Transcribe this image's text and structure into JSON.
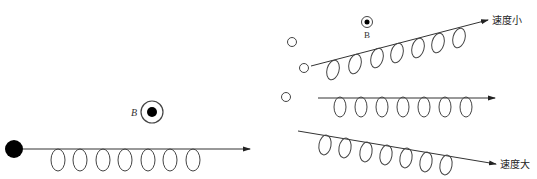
{
  "diagram": {
    "colors": {
      "stroke": "#444444",
      "fill_dark": "#000000",
      "background": "#ffffff"
    },
    "field_symbols": [
      {
        "label": "B",
        "style": "italic",
        "cx": 152,
        "cy": 112,
        "r_outer": 11,
        "r_inner": 5
      },
      {
        "label": "B",
        "style": "upright",
        "cx": 367,
        "cy": 22,
        "r_outer": 5.5,
        "r_inner": 2.5
      }
    ],
    "source_particle": {
      "cx": 14,
      "cy": 149,
      "r": 9
    },
    "incoming_beam": {
      "x1": 23,
      "y1": 149,
      "x2": 250,
      "y2": 149,
      "loops": [
        {
          "cx": 58,
          "cy": 160
        },
        {
          "cx": 80,
          "cy": 160
        },
        {
          "cx": 103,
          "cy": 160
        },
        {
          "cx": 125,
          "cy": 160
        },
        {
          "cx": 148,
          "cy": 160
        },
        {
          "cx": 170,
          "cy": 160
        },
        {
          "cx": 193,
          "cy": 160
        }
      ]
    },
    "split_particles": [
      {
        "cx": 292,
        "cy": 42,
        "r": 4.5
      },
      {
        "cx": 304,
        "cy": 68,
        "r": 4.5
      },
      {
        "cx": 286,
        "cy": 97,
        "r": 4.5
      }
    ],
    "beams": [
      {
        "name": "slow",
        "label": "速度小",
        "x1": 311,
        "y1": 66,
        "x2": 488,
        "y2": 20,
        "label_x": 492,
        "label_y": 22,
        "loops": [
          {
            "cx": 333,
            "cy": 70
          },
          {
            "cx": 355,
            "cy": 64
          },
          {
            "cx": 377,
            "cy": 58
          },
          {
            "cx": 397,
            "cy": 53
          },
          {
            "cx": 418,
            "cy": 48
          },
          {
            "cx": 438,
            "cy": 43
          },
          {
            "cx": 459,
            "cy": 38
          }
        ]
      },
      {
        "name": "medium",
        "label": "",
        "x1": 318,
        "y1": 98,
        "x2": 495,
        "y2": 98,
        "loops": [
          {
            "cx": 340,
            "cy": 107
          },
          {
            "cx": 361,
            "cy": 107
          },
          {
            "cx": 382,
            "cy": 107
          },
          {
            "cx": 403,
            "cy": 107
          },
          {
            "cx": 424,
            "cy": 107
          },
          {
            "cx": 445,
            "cy": 107
          },
          {
            "cx": 466,
            "cy": 107
          }
        ]
      },
      {
        "name": "fast",
        "label": "速度大",
        "x1": 298,
        "y1": 131,
        "x2": 496,
        "y2": 164,
        "label_x": 500,
        "label_y": 167,
        "loops": [
          {
            "cx": 325,
            "cy": 145
          },
          {
            "cx": 345,
            "cy": 148
          },
          {
            "cx": 366,
            "cy": 152
          },
          {
            "cx": 386,
            "cy": 155
          },
          {
            "cx": 406,
            "cy": 158
          },
          {
            "cx": 426,
            "cy": 162
          },
          {
            "cx": 446,
            "cy": 165
          }
        ]
      }
    ]
  }
}
